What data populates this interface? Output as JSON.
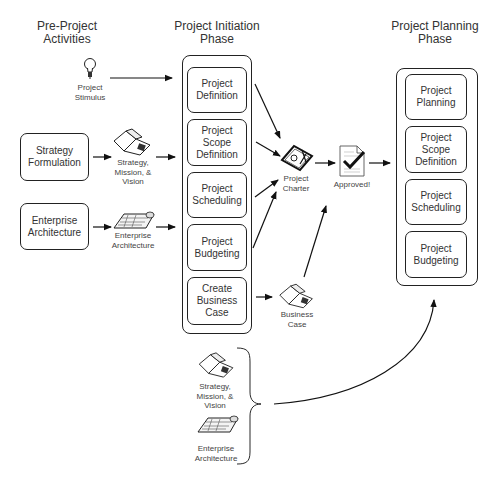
{
  "headings": {
    "pre_project": "Pre-Project\nActivities",
    "initiation": "Project Initiation\nPhase",
    "planning": "Project Planning\nPhase"
  },
  "pre_project": {
    "stimulus_label": "Project\nStimulus",
    "strategy_box": "Strategy\nFormulation",
    "strategy_artifact": "Strategy,\nMission, &\nVision",
    "enterprise_box": "Enterprise\nArchitecture",
    "enterprise_artifact": "Enterprise\nArchitecture"
  },
  "initiation": {
    "steps": [
      "Project\nDefinition",
      "Project Scope\nDefinition",
      "Project\nScheduling",
      "Project\nBudgeting",
      "Create\nBusiness\nCase"
    ],
    "charter_label": "Project\nCharter",
    "approved_label": "Approved!",
    "business_case_label": "Business\nCase"
  },
  "planning": {
    "steps": [
      "Project\nPlanning",
      "Project Scope\nDefinition",
      "Project\nScheduling",
      "Project\nBudgeting"
    ]
  },
  "inputs_group": {
    "strategy_artifact": "Strategy,\nMission, &\nVision",
    "enterprise_artifact": "Enterprise\nArchitecture"
  },
  "icons": {
    "stimulus": "lightbulb-icon",
    "strategy": "open-book-icon",
    "enterprise": "blueprint-icon",
    "charter": "signed-document-icon",
    "approved": "checkmark-document-icon",
    "business_case": "open-book-icon"
  },
  "colors": {
    "stroke": "#222222",
    "text": "#333333",
    "background": "#ffffff"
  }
}
